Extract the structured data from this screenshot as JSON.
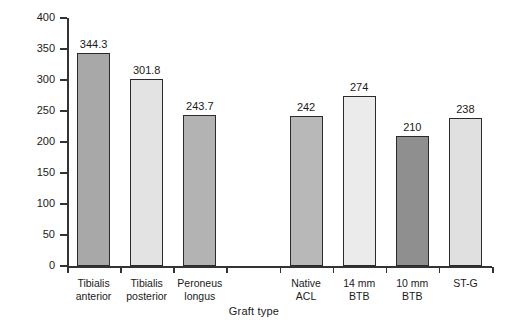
{
  "chart_data": {
    "type": "bar",
    "title": "",
    "xlabel": "Graft type",
    "ylabel": "Stiffness",
    "ylim": [
      0,
      400
    ],
    "yticks": [
      0,
      50,
      100,
      150,
      200,
      250,
      300,
      350,
      400
    ],
    "grid": false,
    "legend": null,
    "categories": [
      "Tibialis anterior",
      "Tibialis posterior",
      "Peroneus longus",
      "Native ACL",
      "14 mm BTB",
      "10 mm BTB",
      "ST-G"
    ],
    "category_lines": [
      [
        "Tibialis",
        "anterior"
      ],
      [
        "Tibialis",
        "posterior"
      ],
      [
        "Peroneus",
        "longus"
      ],
      [
        "Native",
        "ACL"
      ],
      [
        "14 mm",
        "BTB"
      ],
      [
        "10 mm",
        "BTB"
      ],
      [
        "ST-G",
        ""
      ]
    ],
    "values": [
      344.3,
      301.8,
      243.7,
      242,
      274,
      210,
      238
    ],
    "value_labels": [
      "344.3",
      "301.8",
      "243.7",
      "242",
      "274",
      "210",
      "238"
    ],
    "bar_colors": [
      "#a8a8a8",
      "#e3e3e3",
      "#b3b3b3",
      "#b8b8b8",
      "#ebebeb",
      "#8f8f8f",
      "#e0e0e0"
    ],
    "bar_edge_color": "#2b2b2b"
  },
  "axis": {
    "y_title": "Stiffness",
    "x_title": "Graft type",
    "y_labels": [
      "400",
      "350",
      "300",
      "250",
      "200",
      "150",
      "100",
      "50",
      "0"
    ]
  }
}
